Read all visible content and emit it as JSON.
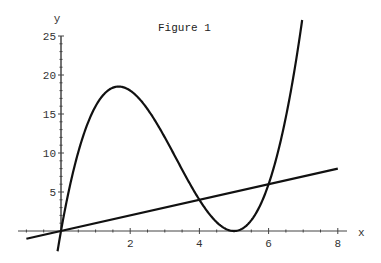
{
  "chart_data": {
    "type": "line",
    "title": "Figure 1",
    "xlabel": "x",
    "ylabel": "y",
    "xlim": [
      -1,
      8.2
    ],
    "ylim": [
      -3,
      25
    ],
    "x_ticks": [
      2,
      4,
      6,
      8
    ],
    "y_ticks": [
      5,
      10,
      15,
      20,
      25
    ],
    "grid": false,
    "legend": null,
    "series": [
      {
        "name": "y = x(x-5)^2",
        "x": [
          -0.1,
          0,
          0.5,
          1,
          1.5,
          1.667,
          2,
          2.5,
          3,
          3.5,
          4,
          4.5,
          5,
          5.5,
          6,
          6.5,
          6.97
        ],
        "values": [
          -2.6,
          0,
          10.125,
          16,
          18.375,
          18.52,
          18,
          15.625,
          12,
          7.875,
          4,
          1.125,
          0,
          1.375,
          6,
          14.625,
          25
        ]
      },
      {
        "name": "y = x",
        "x": [
          -1,
          8
        ],
        "values": [
          -1,
          8
        ]
      }
    ],
    "annotations": [
      "intersections at (0,0), (4,4), (6,6)"
    ]
  },
  "axes": {
    "title": "Figure 1",
    "xlabel": "x",
    "ylabel": "y",
    "x_tick_labels": [
      "2",
      "4",
      "6",
      "8"
    ],
    "y_tick_labels": [
      "5",
      "10",
      "15",
      "20",
      "25"
    ]
  },
  "colors": {
    "curve": "#111111",
    "axis": "#444444",
    "background": "#ffffff"
  }
}
